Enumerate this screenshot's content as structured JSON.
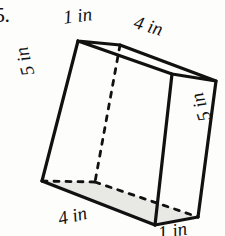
{
  "problem": {
    "number": "5."
  },
  "figure": {
    "shape_name": "rectangular-prism",
    "line_color": "#111111",
    "shade_color": "#e8e8e4",
    "background_color": "#fdfdfb"
  },
  "labels": {
    "top_left": "1 in",
    "top_right": "4 in",
    "left": "5 in",
    "right": "5 in",
    "bottom_left": "4 in",
    "bottom_right": "1 in"
  },
  "geometry": {
    "vertices": {
      "top_front_left": [
        78,
        41
      ],
      "top_back_left": [
        120,
        45
      ],
      "top_back_right": [
        216,
        81
      ],
      "top_front_right": [
        172,
        74
      ],
      "bottom_front_left": [
        42,
        181
      ],
      "bottom_back_left": [
        95,
        182
      ],
      "bottom_back_right": [
        198,
        217
      ],
      "bottom_front_right": [
        155,
        225
      ]
    },
    "hidden_edges": [
      "top_back_left-bottom_back_left",
      "bottom_back_left-bottom_front_left",
      "bottom_back_left-bottom_back_right"
    ]
  }
}
